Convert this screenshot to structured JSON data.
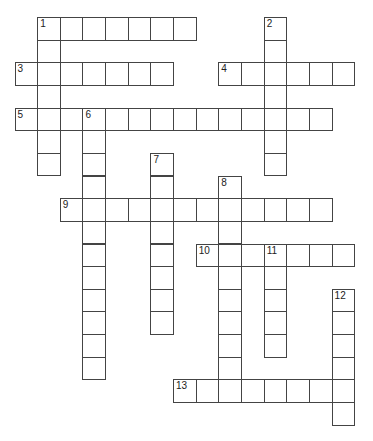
{
  "puzzle": {
    "grid": {
      "origin_x": 14.5,
      "origin_y": 17,
      "cell_size": 22.65,
      "border_color": "#444444"
    },
    "words": [
      {
        "number": "1",
        "direction": "across",
        "row": 0,
        "col": 1,
        "length": 7
      },
      {
        "number": "1",
        "direction": "down",
        "row": 0,
        "col": 1,
        "length": 7
      },
      {
        "number": "2",
        "direction": "down",
        "row": 0,
        "col": 11,
        "length": 7
      },
      {
        "number": "3",
        "direction": "across",
        "row": 2,
        "col": 0,
        "length": 7
      },
      {
        "number": "4",
        "direction": "across",
        "row": 2,
        "col": 9,
        "length": 6
      },
      {
        "number": "5",
        "direction": "across",
        "row": 4,
        "col": 0,
        "length": 14
      },
      {
        "number": "6",
        "direction": "down",
        "row": 4,
        "col": 3,
        "length": 12
      },
      {
        "number": "7",
        "direction": "down",
        "row": 6,
        "col": 6,
        "length": 8
      },
      {
        "number": "8",
        "direction": "down",
        "row": 7,
        "col": 9,
        "length": 10
      },
      {
        "number": "9",
        "direction": "across",
        "row": 8,
        "col": 2,
        "length": 12
      },
      {
        "number": "10",
        "direction": "across",
        "row": 10,
        "col": 8,
        "length": 7
      },
      {
        "number": "11",
        "direction": "down",
        "row": 10,
        "col": 11,
        "length": 5
      },
      {
        "number": "12",
        "direction": "down",
        "row": 12,
        "col": 14,
        "length": 6
      },
      {
        "number": "13",
        "direction": "across",
        "row": 16,
        "col": 7,
        "length": 8
      }
    ]
  }
}
